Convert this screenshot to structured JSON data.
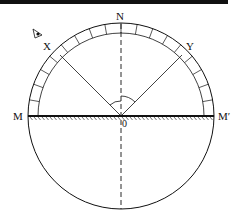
{
  "diagram": {
    "labels": {
      "top": "N",
      "left_ray": "X",
      "right_ray": "Y",
      "mirror_left": "M",
      "mirror_right": "M′",
      "center": "0"
    },
    "colors": {
      "stroke": "#111111",
      "background": "#ffffff",
      "topbar": "#111111"
    }
  }
}
